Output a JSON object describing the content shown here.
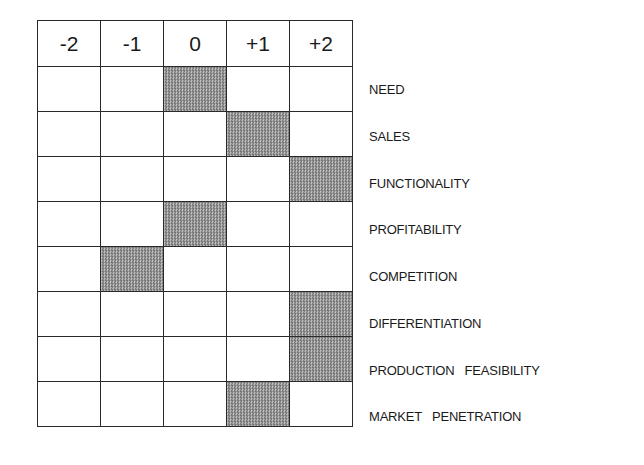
{
  "scale": {
    "columns": [
      "-2",
      "-1",
      "0",
      "+1",
      "+2"
    ]
  },
  "criteria": [
    {
      "label": "NEED",
      "rating": "0"
    },
    {
      "label": "SALES",
      "rating": "+1"
    },
    {
      "label": "FUNCTIONALITY",
      "rating": "+2"
    },
    {
      "label": "PROFITABILITY",
      "rating": "0"
    },
    {
      "label": "COMPETITION",
      "rating": "-1"
    },
    {
      "label": "DIFFERENTIATION",
      "rating": "+2"
    },
    {
      "label": "PRODUCTION   FEASIBILITY",
      "rating": "+2"
    },
    {
      "label": "MARKET   PENETRATION",
      "rating": "+1"
    }
  ],
  "colors": {
    "grid_line": "#2a2a2a",
    "shade_dark": "#555555",
    "shade_light": "#e4e4e4",
    "text": "#1a1a1a"
  }
}
